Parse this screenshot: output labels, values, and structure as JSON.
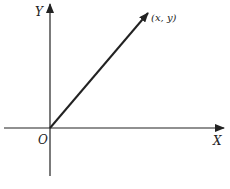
{
  "diagram": {
    "type": "coordinate-vector",
    "axes": {
      "x_label": "X",
      "y_label": "Y",
      "origin_label": "O"
    },
    "vector": {
      "from": "origin",
      "label": "(x, y)"
    },
    "colors": {
      "stroke": "#222222",
      "background": "#ffffff"
    }
  }
}
